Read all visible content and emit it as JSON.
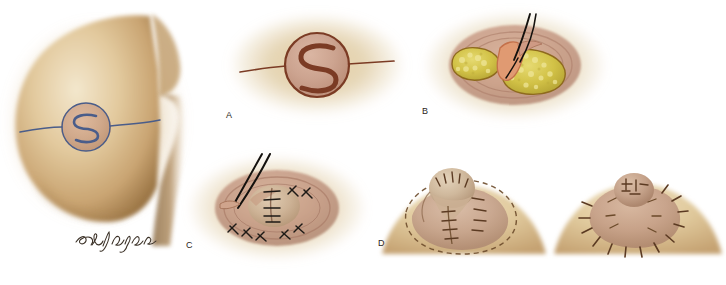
{
  "figure": {
    "kind": "medical-surgical-illustration",
    "background_color": "#ffffff",
    "signature_text": "Seldigger",
    "palette": {
      "skin_light": "#efe0c2",
      "skin_mid": "#d9bc8e",
      "skin_shadow": "#a07c4e",
      "skin_deep_shadow": "#6b4a24",
      "areola_pink": "#c49a86",
      "areola_mid": "#b98d78",
      "incision_brown": "#7b3b24",
      "marking_blue": "#4a5d8a",
      "fat_yellow": "#d4c44a",
      "fat_yellow_light": "#e3d86a",
      "dermis_orange": "#e0926a",
      "suture_black": "#1e1a16",
      "suture_brown": "#5b3a22",
      "dashed_marking": "#6b4a2a"
    }
  },
  "panels": [
    {
      "id": "overview",
      "label": "",
      "caption": "Lateral view of breast with S-shaped flap design marked on areola",
      "markings": [
        "horizontal meridian line",
        "areola circle",
        "S incision"
      ],
      "marking_color": "#4a5d8a"
    },
    {
      "id": "a",
      "label": "A",
      "caption": "Close-up of areola with S-shaped incision design and horizontal extension lines",
      "markings": [
        "areola circle",
        "S incision",
        "lateral extension lines"
      ],
      "marking_color": "#7b3b24"
    },
    {
      "id": "b",
      "label": "B",
      "caption": "Flap elevated, subcutaneous fat exposed, suture placed with needle",
      "markings": [
        "elevated dermal flap",
        "exposed fat lobules",
        "needle and suture"
      ],
      "marking_color": "#d4c44a"
    },
    {
      "id": "c",
      "label": "C",
      "caption": "Flap wrapped and closed with interrupted sutures, needle holder in place",
      "markings": [
        "interrupted sutures",
        "instrument tips",
        "wound closure"
      ],
      "marking_color": "#1e1a16"
    },
    {
      "id": "d",
      "label": "D",
      "caption": "Reconstructed nipple projecting, dashed line marks planned areola border",
      "markings": [
        "projecting nipple",
        "interrupted sutures",
        "dashed areola outline"
      ],
      "marking_color": "#5b3a22"
    },
    {
      "id": "e",
      "label": "",
      "caption": "Completed reconstruction with radial sutures around areola circumference",
      "markings": [
        "radial sutures",
        "healed areola",
        "nipple projection"
      ],
      "marking_color": "#5b3a22"
    }
  ]
}
